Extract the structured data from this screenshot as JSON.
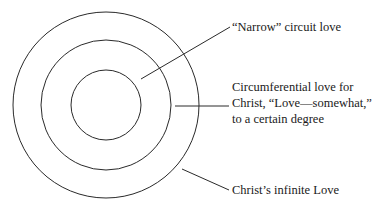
{
  "diagram": {
    "type": "concentric-circles",
    "center": [
      106,
      105
    ],
    "circles": [
      {
        "name": "outer",
        "radius": 93
      },
      {
        "name": "middle",
        "radius": 65
      },
      {
        "name": "inner",
        "radius": 35
      }
    ],
    "labels": {
      "narrow": "“Narrow” circuit love",
      "circumferential_line1": "Circumferential love for",
      "circumferential_line2": "Christ, “Love—somewhat,”",
      "circumferential_line3": "to a certain degree",
      "infinite": "Christ’s infinite Love"
    },
    "stroke_color": "#2a2a2a"
  }
}
